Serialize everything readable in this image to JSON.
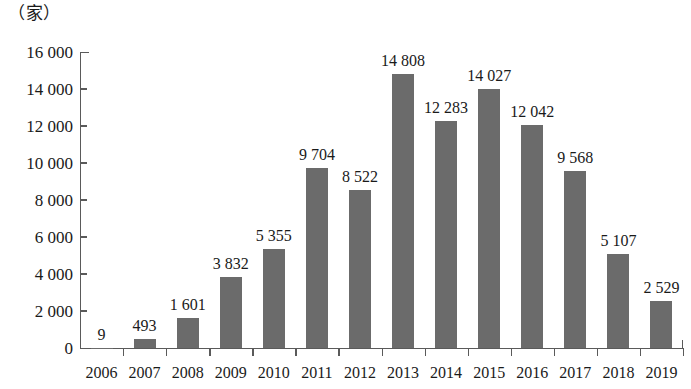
{
  "chart_data": {
    "type": "bar",
    "title": "",
    "subtitle": "",
    "xlabel": "",
    "ylabel": "（家）",
    "unit_caption": "（家）",
    "categories": [
      "2006",
      "2007",
      "2008",
      "2009",
      "2010",
      "2011",
      "2012",
      "2013",
      "2014",
      "2015",
      "2016",
      "2017",
      "2018",
      "2019"
    ],
    "values": [
      9,
      493,
      1601,
      3832,
      5355,
      9704,
      8522,
      14808,
      12283,
      14027,
      12042,
      9568,
      5107,
      2529
    ],
    "data_labels": [
      "9",
      "493",
      "1 601",
      "3 832",
      "5 355",
      "9 704",
      "8 522",
      "14 808",
      "12 283",
      "14 027",
      "12 042",
      "9 568",
      "5 107",
      "2 529"
    ],
    "ylim": [
      0,
      16000
    ],
    "ytick_values": [
      0,
      2000,
      4000,
      6000,
      8000,
      10000,
      12000,
      14000,
      16000
    ],
    "ytick_labels": [
      "0",
      "2 000",
      "4 000",
      "6 000",
      "8 000",
      "10 000",
      "12 000",
      "14 000",
      "16 000"
    ],
    "grid": false,
    "legend": false,
    "legend_position": "none",
    "bar_color": "#6b6b6b",
    "axis_color": "#5a5a5a",
    "text_color": "#1a1a1a",
    "background_color": "#ffffff"
  }
}
